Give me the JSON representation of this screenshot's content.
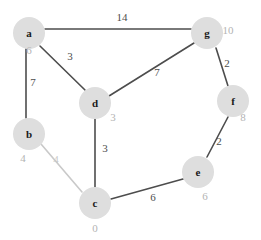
{
  "graph": {
    "type": "weighted-undirected-graph",
    "title": "",
    "canvas": {
      "width": 261,
      "height": 240,
      "background": "#ffffff"
    },
    "colors": {
      "node_fill": "#dedede",
      "node_label": "#1a1a1a",
      "distance_label": "#b3b3b3",
      "edge": "#4d4d4d",
      "weight_label": "#4d4d4d",
      "faint_weight_label": "#c9c9c9"
    },
    "nodes": [
      {
        "id": "a",
        "label": "a",
        "distance": "6",
        "cx": 29,
        "cy": 33,
        "r": 16,
        "dist_x": 29,
        "dist_y": 50
      },
      {
        "id": "b",
        "label": "b",
        "distance": "4",
        "cx": 29,
        "cy": 134,
        "r": 16,
        "dist_x": 23,
        "dist_y": 158
      },
      {
        "id": "c",
        "label": "c",
        "distance": "0",
        "cx": 95,
        "cy": 203,
        "r": 16,
        "dist_x": 95,
        "dist_y": 228
      },
      {
        "id": "d",
        "label": "d",
        "distance": "3",
        "cx": 95,
        "cy": 103,
        "r": 16,
        "dist_x": 113,
        "dist_y": 117
      },
      {
        "id": "e",
        "label": "e",
        "distance": "6",
        "cx": 198,
        "cy": 172,
        "r": 16,
        "dist_x": 205,
        "dist_y": 196
      },
      {
        "id": "f",
        "label": "f",
        "distance": "8",
        "cx": 233,
        "cy": 101,
        "r": 16,
        "dist_x": 243,
        "dist_y": 117
      },
      {
        "id": "g",
        "label": "g",
        "distance": "10",
        "cx": 207,
        "cy": 33,
        "r": 16,
        "dist_x": 228,
        "dist_y": 30
      }
    ],
    "edges": [
      {
        "from": "a",
        "to": "g",
        "weight": "14",
        "x1": 45,
        "y1": 29,
        "x2": 191,
        "y2": 29,
        "wx": 122,
        "wy": 17,
        "faint": false
      },
      {
        "from": "a",
        "to": "b",
        "weight": "7",
        "x1": 26,
        "y1": 49,
        "x2": 26,
        "y2": 118,
        "wx": 33,
        "wy": 82,
        "faint": false
      },
      {
        "from": "a",
        "to": "d",
        "weight": "3",
        "x1": 40,
        "y1": 46,
        "x2": 85,
        "y2": 90,
        "wx": 70,
        "wy": 56,
        "faint": false
      },
      {
        "from": "d",
        "to": "g",
        "weight": "7",
        "x1": 109,
        "y1": 96,
        "x2": 194,
        "y2": 43,
        "wx": 157,
        "wy": 72,
        "faint": false
      },
      {
        "from": "g",
        "to": "f",
        "weight": "2",
        "x1": 216,
        "y1": 48,
        "x2": 228,
        "y2": 86,
        "wx": 227,
        "wy": 63,
        "faint": false
      },
      {
        "from": "f",
        "to": "e",
        "weight": "2",
        "x1": 228,
        "y1": 117,
        "x2": 207,
        "y2": 157,
        "wx": 219,
        "wy": 141,
        "faint": false
      },
      {
        "from": "d",
        "to": "c",
        "weight": "3",
        "x1": 95,
        "y1": 119,
        "x2": 95,
        "y2": 187,
        "wx": 105,
        "wy": 148,
        "faint": false
      },
      {
        "from": "c",
        "to": "e",
        "weight": "6",
        "x1": 111,
        "y1": 199,
        "x2": 183,
        "y2": 179,
        "wx": 153,
        "wy": 197,
        "faint": false
      },
      {
        "from": "b",
        "to": "c",
        "weight": "4",
        "x1": 41,
        "y1": 144,
        "x2": 82,
        "y2": 192,
        "wx": 56,
        "wy": 159,
        "faint": true
      }
    ]
  }
}
